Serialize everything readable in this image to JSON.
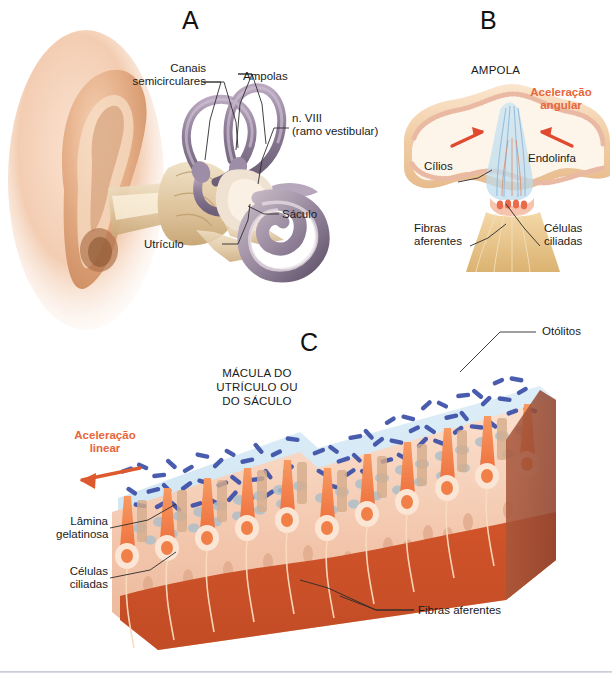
{
  "figure": {
    "background": "#ffffff",
    "accent_color": "#e8663c",
    "otolith_color": "#3b4fa8",
    "hair_cell_color": "#f0784a",
    "nerve_color": "#c94c28",
    "bone_color": "#ddb98c"
  },
  "panels": [
    {
      "letter": "A",
      "name": "labirinto-membranoso",
      "labels": [
        {
          "id": "canais",
          "text": "Canais\nsemicirculares"
        },
        {
          "id": "ampolas",
          "text": "Ampolas"
        },
        {
          "id": "nervo",
          "text": "n. VIII\n(ramo vestibular)"
        },
        {
          "id": "saculo",
          "text": "Sáculo"
        },
        {
          "id": "utriculo",
          "text": "Utrículo"
        }
      ]
    },
    {
      "letter": "B",
      "name": "ampola",
      "heading": "AMPOLA",
      "labels": [
        {
          "id": "aceleracao-angular",
          "text": "Aceleração\nangular",
          "accent": true
        },
        {
          "id": "cilios",
          "text": "Cílios"
        },
        {
          "id": "endolinfa",
          "text": "Endolinfa"
        },
        {
          "id": "fibras-aferentes",
          "text": "Fibras\naferentes"
        },
        {
          "id": "celulas-ciliadas",
          "text": "Células\nciliadas"
        }
      ]
    },
    {
      "letter": "C",
      "name": "macula",
      "heading": "MÁCULA DO\nUTRÍCULO OU\nDO SÁCULO",
      "labels": [
        {
          "id": "otolitos",
          "text": "Otólitos"
        },
        {
          "id": "aceleracao-linear",
          "text": "Aceleração\nlinear",
          "accent": true
        },
        {
          "id": "lamina-gelatinosa",
          "text": "Lâmina\ngelatinosa"
        },
        {
          "id": "celulas-ciliadas",
          "text": "Células\nciliadas"
        },
        {
          "id": "fibras-aferentes",
          "text": "Fibras aferentes"
        }
      ]
    }
  ]
}
